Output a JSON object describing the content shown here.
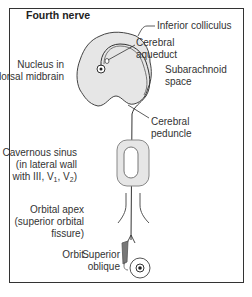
{
  "title": "Fourth nerve",
  "labels": {
    "inferior_colliculus": "Inferior colliculus",
    "cerebral_aqueduct_1": "Cerebral",
    "cerebral_aqueduct_2": "aqueduct",
    "nucleus_1": "Nucleus in",
    "nucleus_2": "dorsal midbrain",
    "subarachnoid_1": "Subarachnoid",
    "subarachnoid_2": "space",
    "peduncle_1": "Cerebral",
    "peduncle_2": "peduncle",
    "cavernous_1": "Cavernous sinus",
    "cavernous_2": "(in lateral wall",
    "cavernous_3_prefix": "with III, V",
    "cavernous_3_sub1": "1",
    "cavernous_3_mid": ", V",
    "cavernous_3_sub2": "2",
    "cavernous_3_suffix": ")",
    "orbital_1": "Orbital apex",
    "orbital_2": "(superior orbital",
    "orbital_3": "fissure)",
    "orbit": "Orbit",
    "superior_oblique_1": "Superior",
    "superior_oblique_2": "oblique"
  },
  "colors": {
    "tissue_fill": "#e6e6e6",
    "stroke": "#333333",
    "frame": "#333333"
  }
}
